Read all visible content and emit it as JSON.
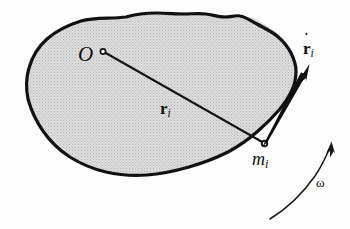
{
  "figure": {
    "kind": "physics-diagram",
    "caption_text": "",
    "background_color": "#fdfdfd",
    "body": {
      "name": "rigid-body-blob",
      "fill_color": "#d6d6d6",
      "outline_color": "#111111",
      "outline_width_px": 3.2,
      "texture": "halftone-stipple"
    },
    "labels": {
      "origin": "O",
      "position_vector_main": "r",
      "position_vector_sub": "i",
      "velocity_vector_main": "r",
      "velocity_vector_sub": "i",
      "mass_point_main": "m",
      "mass_point_sub": "i",
      "angular_velocity": "ω"
    },
    "markers": {
      "origin_point": "open-circle",
      "mass_point": "filled-dot"
    },
    "vectors": {
      "position_vector_style": "thin-line-no-arrowhead",
      "velocity_vector_style": "thick-tapered-arrow",
      "angular_velocity_style": "thin-curved-arrow"
    },
    "colors": {
      "ink": "#101010",
      "body_fill": "#d6d6d6",
      "paper": "#fdfdfd"
    }
  }
}
